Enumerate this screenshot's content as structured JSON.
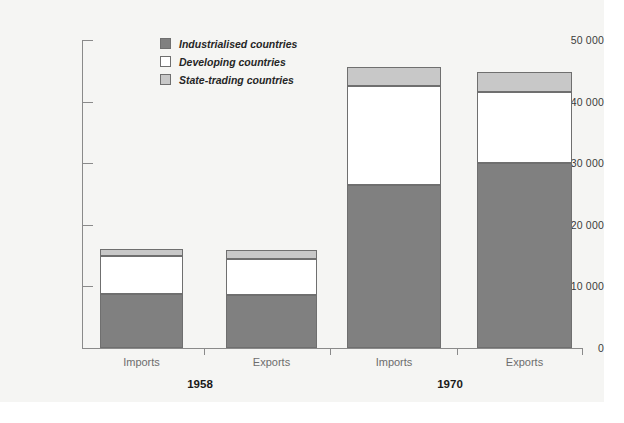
{
  "chart_data": {
    "type": "bar",
    "subtype": "stacked-bar",
    "title": "",
    "xlabel": "",
    "ylabel": "",
    "ylim": [
      0,
      50000
    ],
    "yticks": [
      0,
      10000,
      20000,
      30000,
      40000,
      50000
    ],
    "ytick_labels": [
      "0",
      "10 000",
      "20 000",
      "30 000",
      "40 000",
      "50 000"
    ],
    "grid": false,
    "legend_position": "top-left-inside",
    "categories": [
      "Imports",
      "Exports",
      "Imports",
      "Exports"
    ],
    "groups": [
      {
        "label": "1958",
        "categories": [
          "Imports",
          "Exports"
        ]
      },
      {
        "label": "1970",
        "categories": [
          "Imports",
          "Exports"
        ]
      }
    ],
    "series": [
      {
        "name": "Industrialised countries",
        "color": "#808080",
        "values": [
          8700,
          8600,
          26500,
          30000
        ]
      },
      {
        "name": "Developing countries",
        "color": "#ffffff",
        "values": [
          6200,
          5900,
          16100,
          11600
        ]
      },
      {
        "name": "State-trading countries",
        "color": "#c8c8c8",
        "values": [
          1100,
          1400,
          3000,
          3200
        ]
      }
    ],
    "totals": [
      16000,
      15900,
      45600,
      44800
    ]
  },
  "legend": {
    "items": [
      {
        "label": "Industrialised countries",
        "swatch": "industrialised"
      },
      {
        "label": "Developing countries",
        "swatch": "developing"
      },
      {
        "label": "State-trading countries",
        "swatch": "statetrading"
      }
    ]
  },
  "axis": {
    "y_labels": [
      "50 000",
      "40 000",
      "30 000",
      "20 000",
      "10 000",
      "0"
    ]
  },
  "colors": {
    "industrialised": "#808080",
    "developing": "#ffffff",
    "state_trading": "#c8c8c8",
    "axis": "#8a8a8a",
    "background": "#f5f5f3",
    "category_text": "#6d6d6d",
    "group_text": "#1a1a1a"
  }
}
